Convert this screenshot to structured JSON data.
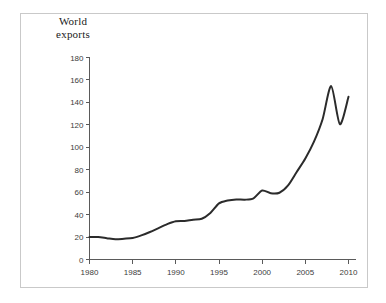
{
  "figure": {
    "border_color": "#c9c9c9",
    "background": "#ffffff"
  },
  "title": {
    "line1": "World",
    "line2": "exports"
  },
  "axes": {
    "y_ticks": [
      "180",
      "160",
      "140",
      "120",
      "100",
      "80",
      "60",
      "40",
      "20",
      "0"
    ],
    "x_ticks": [
      "1980",
      "1985",
      "1990",
      "1995",
      "2000",
      "2005",
      "2010"
    ],
    "axis_color": "#5a5a5a",
    "line_color": "#2b2b2b"
  },
  "chart_data": {
    "type": "line",
    "title": "World exports",
    "xlabel": "",
    "ylabel": "World exports",
    "xlim": [
      1980,
      2010
    ],
    "ylim": [
      0,
      180
    ],
    "ytick_step": 20,
    "xtick_step": 5,
    "grid": false,
    "legend": null,
    "series": [
      {
        "name": "World exports",
        "x": [
          1980,
          1981,
          1982,
          1983,
          1984,
          1985,
          1986,
          1987,
          1988,
          1989,
          1990,
          1991,
          1992,
          1993,
          1994,
          1995,
          1996,
          1997,
          1998,
          1999,
          2000,
          2001,
          2002,
          2003,
          2004,
          2005,
          2006,
          2007,
          2008,
          2009,
          2010
        ],
        "values": [
          20.0,
          20.0,
          19.0,
          18.0,
          18.5,
          19.2,
          21.5,
          24.5,
          28.0,
          31.5,
          34.0,
          34.3,
          35.5,
          36.3,
          41.5,
          50.0,
          52.5,
          53.5,
          53.3,
          54.5,
          61.5,
          59.0,
          59.5,
          66.0,
          78.0,
          90.0,
          105.0,
          125.0,
          154.5,
          120.5,
          145.0
        ]
      }
    ]
  }
}
